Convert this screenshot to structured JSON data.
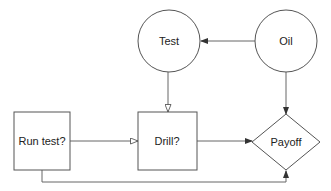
{
  "diagram": {
    "type": "influence-diagram",
    "nodes": [
      {
        "id": "test",
        "label": "Test",
        "shape": "circle",
        "kind": "chance"
      },
      {
        "id": "oil",
        "label": "Oil",
        "shape": "circle",
        "kind": "chance"
      },
      {
        "id": "run_test",
        "label": "Run test?",
        "shape": "rectangle",
        "kind": "decision"
      },
      {
        "id": "drill",
        "label": "Drill?",
        "shape": "rectangle",
        "kind": "decision"
      },
      {
        "id": "payoff",
        "label": "Payoff",
        "shape": "diamond",
        "kind": "value"
      }
    ],
    "edges": [
      {
        "from": "oil",
        "to": "test",
        "arrow": "filled"
      },
      {
        "from": "test",
        "to": "drill",
        "arrow": "open"
      },
      {
        "from": "run_test",
        "to": "drill",
        "arrow": "open"
      },
      {
        "from": "oil",
        "to": "payoff",
        "arrow": "filled"
      },
      {
        "from": "drill",
        "to": "payoff",
        "arrow": "filled"
      },
      {
        "from": "run_test",
        "to": "payoff",
        "arrow": "filled"
      }
    ]
  },
  "labels": {
    "test": "Test",
    "oil": "Oil",
    "run_test": "Run test?",
    "drill": "Drill?",
    "payoff": "Payoff"
  },
  "colors": {
    "stroke": "#555555",
    "edge": "#666666",
    "text": "#222222",
    "background": "#ffffff"
  }
}
